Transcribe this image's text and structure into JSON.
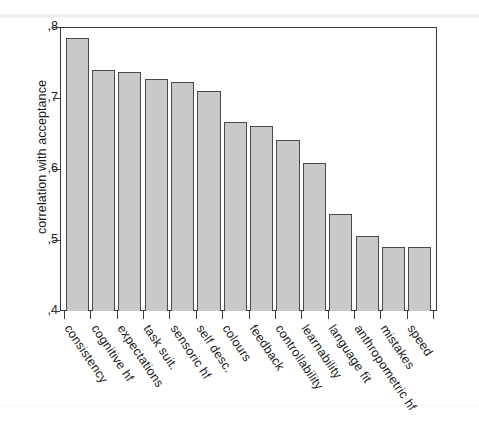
{
  "chart_data": {
    "type": "bar",
    "title": "",
    "subtitle": "",
    "xlabel": "",
    "ylabel": "correlation with acceptance",
    "ylim": [
      0.4,
      0.8
    ],
    "ytick_labels": [
      ",8",
      ",7",
      ",6",
      ",5",
      ",4"
    ],
    "ytick_values": [
      0.8,
      0.7,
      0.6,
      0.5,
      0.4
    ],
    "grid": false,
    "legend": null,
    "decimal_separator": ",",
    "categories": [
      "consistency",
      "cognitive hf",
      "expectations",
      "task suit.",
      "sensoric hf",
      "self desc.",
      "colours",
      "feedback",
      "controllability",
      "learnability",
      "language fit",
      "anthropometric hf",
      "mistakes",
      "speed"
    ],
    "values": [
      0.785,
      0.739,
      0.737,
      0.727,
      0.722,
      0.71,
      0.666,
      0.66,
      0.641,
      0.608,
      0.537,
      0.505,
      0.49,
      0.49
    ],
    "bar_fill_color": "#c9c9c9",
    "bar_border_color": "#4a4a4a",
    "axis_color": "#3a3a3a",
    "background_color": "#ffffff"
  }
}
